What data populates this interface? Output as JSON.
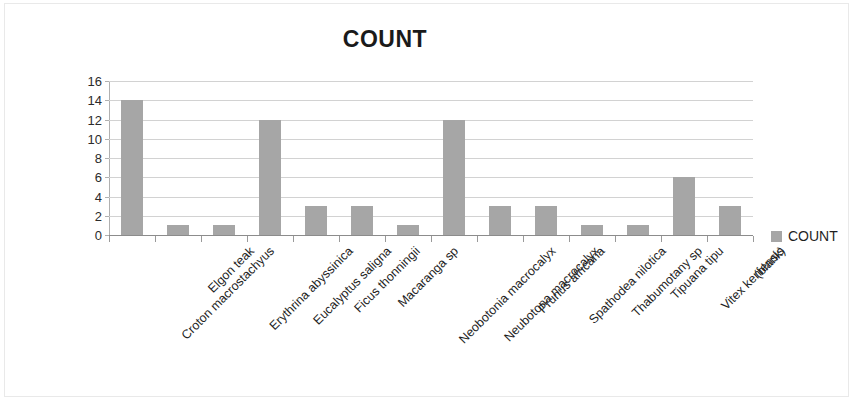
{
  "chart": {
    "title": "COUNT",
    "legend_label": "COUNT",
    "legend_icon": "square-swatch-icon",
    "series_color": "#a6a6a6",
    "gridline_color": "#d2d2d2",
    "axis_color": "#8c8c8c",
    "border_color": "#e9e9e9"
  },
  "chart_data": {
    "type": "bar",
    "title": "COUNT",
    "xlabel": "",
    "ylabel": "",
    "ylim": [
      0,
      16
    ],
    "ytick_step": 2,
    "yticks": [
      0,
      2,
      4,
      6,
      8,
      10,
      12,
      14,
      16
    ],
    "grid": true,
    "legend_position": "right",
    "categories": [
      "Croton macrostachyus",
      "Elgon teak",
      "Erythrina abyssinica",
      "Eucalyptus saligna",
      "Ficus thonningii",
      "Macaranga sp",
      "Neobotonia macrocalyx",
      "Neubotona macrocalyx",
      "Prunus africana",
      "Spathodea nilotica",
      "Thabumotany sp",
      "Tipuana tipu",
      "Vitex keniensis",
      "(blank)"
    ],
    "series": [
      {
        "name": "COUNT",
        "values": [
          14,
          1,
          1,
          12,
          3,
          3,
          1,
          12,
          3,
          3,
          1,
          1,
          6,
          3
        ]
      }
    ]
  }
}
